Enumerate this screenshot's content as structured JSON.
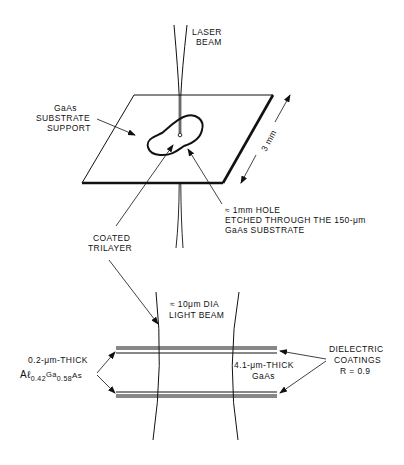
{
  "diagram": {
    "type": "schematic",
    "colors": {
      "ink": "#111111",
      "background": "#ffffff"
    },
    "top_view": {
      "laser_label_line1": "LASER",
      "laser_label_line2": "BEAM",
      "substrate_label_line1": "GaAs",
      "substrate_label_line2": "SUBSTRATE",
      "substrate_label_line3": "SUPPORT",
      "dimension_label": "3 mm",
      "hole_label_line1": "≈ 1mm HOLE",
      "hole_label_line2": "ETCHED THROUGH THE 150-μm",
      "hole_label_line3": "GaAs SUBSTRATE",
      "trilayer_label_line1": "COATED",
      "trilayer_label_line2": "TRILAYER"
    },
    "cross_section": {
      "beam_label_line1": "≈ 10μm DIA",
      "beam_label_line2": "LIGHT BEAM",
      "cladding_label_line1": "0.2-μm-THICK",
      "cladding_material": "Aℓ",
      "cladding_sub1": "0.42",
      "cladding_ga": "Ga",
      "cladding_sub2": "0.58",
      "cladding_as": "As",
      "core_label_line1": "4.1-μm-THICK",
      "core_label_line2": "GaAs",
      "coating_label_line1": "DIELECTRIC",
      "coating_label_line2": "COATINGS",
      "coating_label_line3": "R = 0.9"
    }
  }
}
